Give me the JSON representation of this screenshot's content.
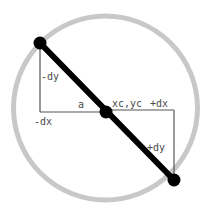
{
  "figure": {
    "background_color": "#ffffff",
    "width": 210,
    "height": 219
  },
  "colors": {
    "circle_stroke": "#c8c8c8",
    "chord_stroke": "#000000",
    "helper_line": "#555555",
    "label_text": "#4a4a4a",
    "node_fill": "#000000"
  },
  "circle": {
    "name": "outer-circle",
    "cx": 105.5,
    "cy": 108,
    "r": 92,
    "stroke_width": 5
  },
  "chord": {
    "name": "chord-line",
    "stroke_width": 6,
    "start": {
      "x": 40,
      "y": 43
    },
    "end": {
      "x": 174,
      "y": 180
    }
  },
  "nodes": [
    {
      "name": "endpoint-top-left",
      "x": 40,
      "y": 43,
      "r": 6.5
    },
    {
      "name": "center-point",
      "x": 106,
      "y": 112,
      "r": 6.5
    },
    {
      "name": "endpoint-bottom-right",
      "x": 174,
      "y": 180,
      "r": 6.5
    }
  ],
  "helper_lines": [
    {
      "name": "left-vertical-leg",
      "x1": 40,
      "y1": 45,
      "x2": 40,
      "y2": 112
    },
    {
      "name": "left-horizontal-leg",
      "x1": 40,
      "y1": 112,
      "x2": 106,
      "y2": 112
    },
    {
      "name": "right-horizontal-leg",
      "x1": 106,
      "y1": 110,
      "x2": 174,
      "y2": 110
    },
    {
      "name": "right-vertical-leg",
      "x1": 174,
      "y1": 110,
      "x2": 174,
      "y2": 180
    }
  ],
  "labels": {
    "neg_dy": {
      "text": "-dy",
      "x": 41,
      "y": 80
    },
    "neg_dx": {
      "text": "-dx",
      "x": 34,
      "y": 125
    },
    "a": {
      "text": "a",
      "x": 78,
      "y": 108
    },
    "center": {
      "text": "xc,yc",
      "x": 112,
      "y": 107
    },
    "pos_dx": {
      "text": "+dx",
      "x": 150,
      "y": 107
    },
    "pos_dy": {
      "text": "+dy",
      "x": 147,
      "y": 151
    }
  }
}
